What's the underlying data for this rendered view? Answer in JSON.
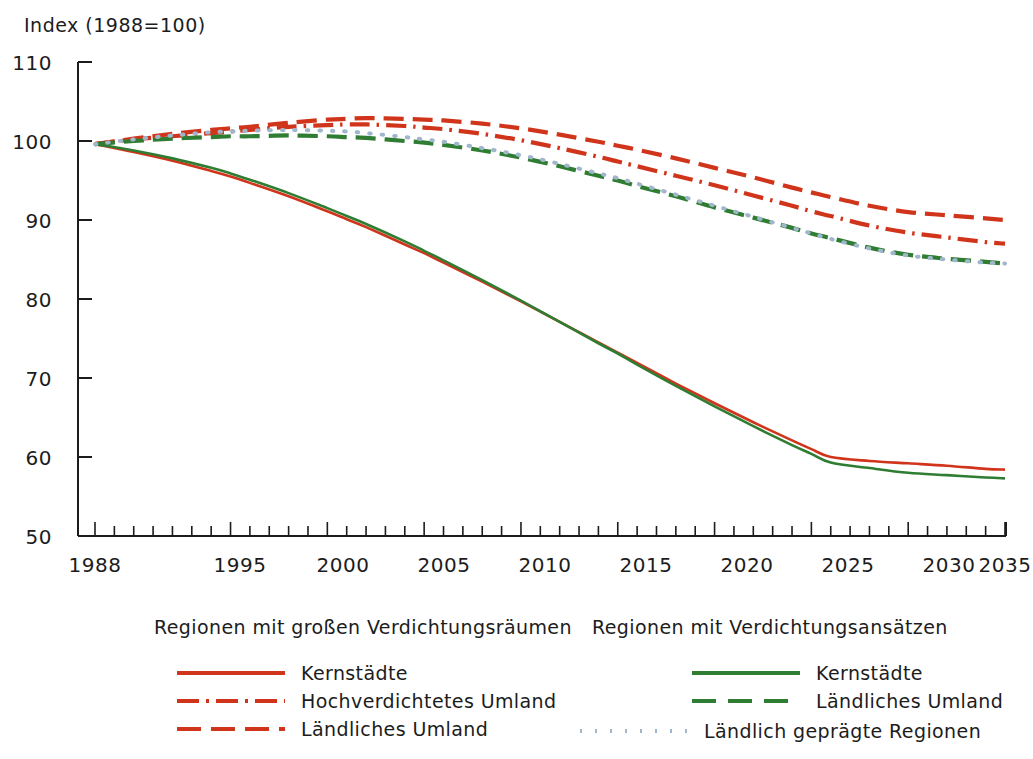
{
  "chart": {
    "axis_title": "Index (1988=100)",
    "ylabels": [
      "110",
      "100",
      "90",
      "80",
      "70",
      "60",
      "50"
    ],
    "xlabels": [
      "1988",
      "1995",
      "2000",
      "2005",
      "2010",
      "2015",
      "2020",
      "2025",
      "2030",
      "2035"
    ]
  },
  "legend": {
    "left": {
      "heading": "Regionen mit großen Verdichtungsräumen",
      "items": [
        {
          "label": "Kernstädte",
          "style": "solid",
          "color": "#D0351C"
        },
        {
          "label": "Hochverdichtetes Umland",
          "style": "dashdot",
          "color": "#D0351C"
        },
        {
          "label": "Ländliches Umland",
          "style": "dashed",
          "color": "#D0351C"
        }
      ]
    },
    "right": {
      "heading": "Regionen mit Verdichtungsansätzen",
      "items": [
        {
          "label": "Kernstädte",
          "style": "solid",
          "color": "#2E7D32"
        },
        {
          "label": "Ländliches Umland",
          "style": "dashed",
          "color": "#2E7D32"
        }
      ]
    },
    "extra": [
      {
        "label": "Ländlich geprägte Regionen",
        "style": "dotted",
        "color": "#9FB6CC"
      }
    ]
  },
  "colors": {
    "red": "#D0351C",
    "green": "#2E7D32",
    "blue_dotted": "#9FB6CC",
    "axis": "#1c1c1c",
    "background": "#ffffff"
  },
  "chart_data": {
    "type": "line",
    "title": "Index (1988=100)",
    "xlabel": "",
    "ylabel": "Index (1988=100)",
    "xlim": [
      1988,
      2035
    ],
    "ylim": [
      50,
      110
    ],
    "yticks": [
      50,
      60,
      70,
      80,
      90,
      100,
      110
    ],
    "xticks": [
      1988,
      1995,
      2000,
      2005,
      2010,
      2015,
      2020,
      2025,
      2030,
      2035
    ],
    "grid": false,
    "legend_position": "below",
    "x": [
      1988,
      1990,
      1992,
      1994,
      1995,
      1996,
      1998,
      2000,
      2001,
      2002,
      2004,
      2005,
      2006,
      2008,
      2010,
      2012,
      2014,
      2015,
      2016,
      2018,
      2020,
      2022,
      2024,
      2025,
      2026,
      2028,
      2030,
      2032,
      2034,
      2035
    ],
    "series": [
      {
        "name": "Kernstädte (Regionen mit großen Verdichtungsräumen)",
        "group": "Regionen mit großen Verdichtungsräumen",
        "style": "solid",
        "color": "#D0351C",
        "values": [
          99.6,
          98.6,
          97.5,
          96.2,
          95.5,
          94.7,
          93.0,
          91.1,
          90.1,
          89.1,
          86.9,
          85.8,
          84.6,
          82.2,
          79.7,
          77.1,
          74.5,
          73.2,
          71.9,
          69.3,
          66.8,
          64.4,
          62.1,
          61.0,
          60.0,
          59.5,
          59.2,
          58.9,
          58.5,
          58.4
        ]
      },
      {
        "name": "Hochverdichtetes Umland (Regionen mit großen Verdichtungsräumen)",
        "group": "Regionen mit großen Verdichtungsräumen",
        "style": "dashdot",
        "color": "#D0351C",
        "values": [
          99.6,
          100.2,
          100.6,
          101.0,
          101.2,
          101.4,
          101.8,
          102.0,
          102.1,
          102.1,
          101.9,
          101.7,
          101.5,
          100.9,
          100.1,
          99.1,
          98.0,
          97.4,
          96.8,
          95.6,
          94.4,
          93.1,
          91.8,
          91.1,
          90.5,
          89.3,
          88.4,
          87.8,
          87.2,
          87.0
        ]
      },
      {
        "name": "Ländliches Umland (Regionen mit großen Verdichtungsräumen)",
        "group": "Regionen mit großen Verdichtungsräumen",
        "style": "dashed",
        "color": "#D0351C",
        "values": [
          99.6,
          100.3,
          100.9,
          101.4,
          101.6,
          101.8,
          102.3,
          102.7,
          102.8,
          102.9,
          102.8,
          102.7,
          102.6,
          102.2,
          101.6,
          100.8,
          99.9,
          99.4,
          98.9,
          97.8,
          96.6,
          95.4,
          94.1,
          93.5,
          92.9,
          91.8,
          91.0,
          90.6,
          90.2,
          90.0
        ]
      },
      {
        "name": "Kernstädte (Regionen mit Verdichtungsansätzen)",
        "group": "Regionen mit Verdichtungsansätzen",
        "style": "solid",
        "color": "#2E7D32",
        "values": [
          99.6,
          98.8,
          97.8,
          96.6,
          95.9,
          95.1,
          93.4,
          91.5,
          90.5,
          89.5,
          87.3,
          86.1,
          84.9,
          82.4,
          79.8,
          77.1,
          74.4,
          73.1,
          71.7,
          69.0,
          66.4,
          63.9,
          61.5,
          60.4,
          59.3,
          58.6,
          58.0,
          57.7,
          57.4,
          57.3
        ]
      },
      {
        "name": "Ländliches Umland (Regionen mit Verdichtungsansätzen)",
        "group": "Regionen mit Verdichtungsansätzen",
        "style": "dashed",
        "color": "#2E7D32",
        "values": [
          99.6,
          100.0,
          100.3,
          100.5,
          100.6,
          100.6,
          100.7,
          100.6,
          100.5,
          100.4,
          100.0,
          99.8,
          99.5,
          98.8,
          97.9,
          96.8,
          95.6,
          95.0,
          94.3,
          93.0,
          91.6,
          90.3,
          89.0,
          88.3,
          87.7,
          86.5,
          85.6,
          85.1,
          84.7,
          84.5
        ]
      },
      {
        "name": "Ländlich geprägte Regionen",
        "group": "Ländlich geprägte Regionen",
        "style": "dotted",
        "color": "#9FB6CC",
        "values": [
          99.6,
          100.2,
          100.7,
          101.1,
          101.2,
          101.3,
          101.4,
          101.3,
          101.2,
          101.0,
          100.5,
          100.2,
          99.9,
          99.1,
          98.2,
          97.1,
          95.9,
          95.3,
          94.6,
          93.2,
          91.8,
          90.4,
          89.0,
          88.3,
          87.6,
          86.4,
          85.5,
          85.0,
          84.6,
          84.5
        ]
      }
    ]
  }
}
